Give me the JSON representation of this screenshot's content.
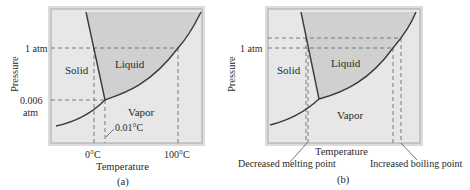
{
  "panels": [
    {
      "id": "a",
      "caption": "(a)",
      "xlabel": "Temperature",
      "ylabel": "Pressure",
      "regions": {
        "solid": "Solid",
        "liquid": "Liquid",
        "vapor": "Vapor"
      },
      "y_ticks": [
        "1 atm",
        "0.006",
        "atm"
      ],
      "x_ticks": [
        "0°C",
        "100°C"
      ],
      "annotations": [
        "0.01°C"
      ]
    },
    {
      "id": "b",
      "caption": "(b)",
      "xlabel": "Temperature",
      "ylabel": "Pressure",
      "regions": {
        "solid": "Solid",
        "liquid": "Liquid",
        "vapor": "Vapor"
      },
      "y_ticks": [
        "1 atm"
      ],
      "annotations": [
        "Decreased melting point",
        "Increased boiling point"
      ]
    }
  ],
  "colors": {
    "frame_outer": "#d9d9d9",
    "frame_inner": "#b5b5b5",
    "solid_vapor_fill": "#e6e6e6",
    "liquid_fill": "#cfcfcf",
    "curve": "#3a3a3a",
    "dashed": "#6e6e6e",
    "text": "#2a2a2a"
  }
}
